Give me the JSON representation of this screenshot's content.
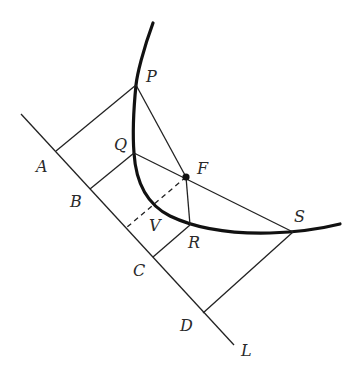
{
  "figure": {
    "colors": {
      "stroke": "#222222",
      "background": "#ffffff"
    },
    "labels": {
      "P": "P",
      "Q": "Q",
      "F": "F",
      "V": "V",
      "R": "R",
      "S": "S",
      "A": "A",
      "B": "B",
      "C": "C",
      "D": "D",
      "L": "L"
    },
    "points": {
      "P": [
        136,
        85
      ],
      "Q": [
        134,
        153
      ],
      "F": [
        186,
        177
      ],
      "R": [
        190,
        225
      ],
      "S": [
        293,
        232
      ],
      "A": [
        56,
        151
      ],
      "B": [
        90,
        189
      ],
      "C": [
        153,
        257
      ],
      "D": [
        203,
        313
      ],
      "V_foot": [
        126,
        228
      ]
    }
  }
}
